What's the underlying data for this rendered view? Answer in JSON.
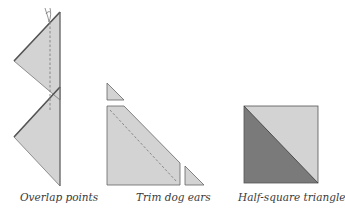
{
  "colors": {
    "light_fabric": "#d3d3d3",
    "dark_fabric": "#7a7a7a",
    "outline": "#555555",
    "dashed_seam": "#888888",
    "background": "#ffffff"
  },
  "figures": [
    {
      "id": "overlap-points",
      "caption": "Overlap points",
      "elements": [
        "upper triangle",
        "lower triangle",
        "dashed seam line",
        "pin/thread tail"
      ]
    },
    {
      "id": "trim-dog-ears",
      "caption": "Trim dog ears",
      "elements": [
        "trimmed top dog ear",
        "sewn trapezoid with dashed seam",
        "trimmed right dog ear"
      ]
    },
    {
      "id": "half-square-triangle",
      "caption": "Half-square triangle",
      "elements": [
        "light upper-right triangle",
        "dark lower-left triangle"
      ]
    }
  ]
}
